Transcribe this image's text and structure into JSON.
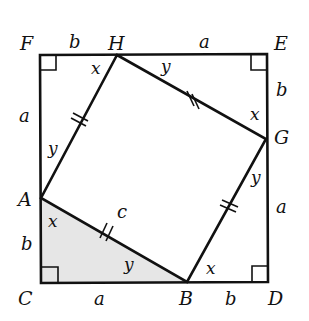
{
  "diagram": {
    "colors": {
      "stroke": "#111111",
      "shade": "#e8e8e8",
      "background": "#ffffff"
    },
    "points": {
      "F": "F",
      "H": "H",
      "E": "E",
      "G": "G",
      "A": "A",
      "C": "C",
      "B": "B",
      "D": "D"
    },
    "sides": {
      "FH": "b",
      "HE": "a",
      "EG": "b",
      "GD": "a",
      "FA": "a",
      "AC": "b",
      "CB": "a",
      "BD": "b",
      "AB": "c"
    },
    "angles": {
      "H_left": "x",
      "H_right": "y",
      "G_top": "x",
      "G_bottom": "y",
      "A_top": "y",
      "A_bottom": "x",
      "B_left": "y",
      "B_right": "x"
    }
  }
}
